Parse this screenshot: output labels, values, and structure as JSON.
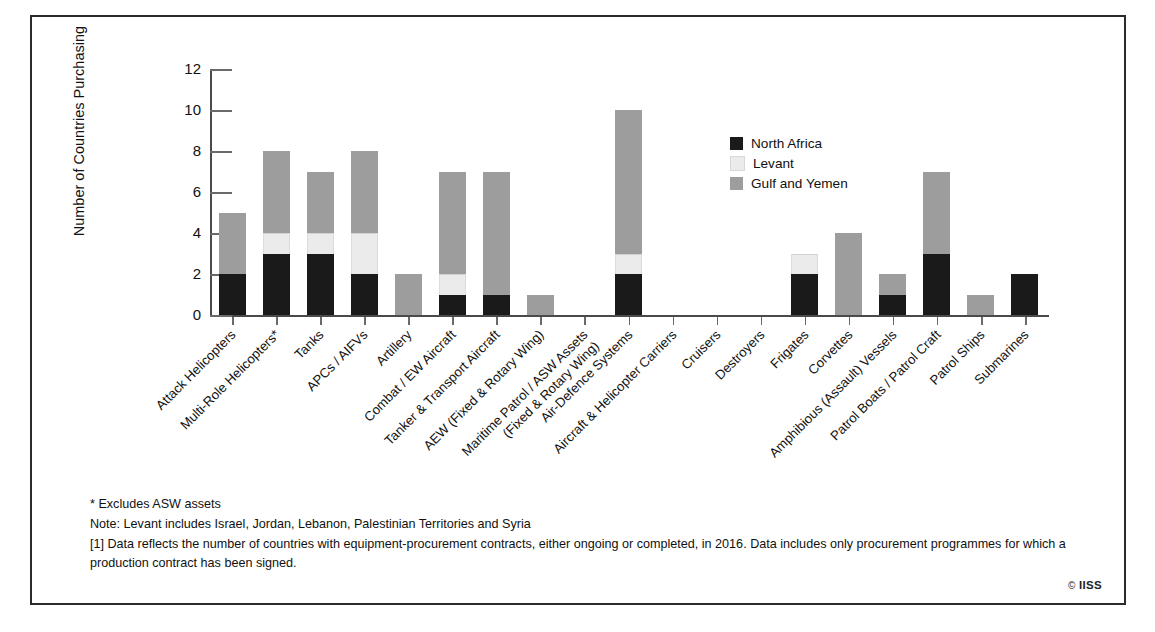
{
  "chart_data": {
    "type": "bar",
    "stacked": true,
    "title": "",
    "xlabel": "",
    "ylabel": "Number of Countries Purchasing",
    "ylim": [
      0,
      12
    ],
    "yticks": [
      0,
      2,
      4,
      6,
      8,
      10,
      12
    ],
    "grid": false,
    "legend_position": "inside-top-right",
    "categories": [
      "Attack Helicopters",
      "Multi-Role Helicopters*",
      "Tanks",
      "APCs / AIFVs",
      "Artillery",
      "Combat / EW Aircraft",
      "Tanker & Transport Aircraft",
      "AEW (Fixed & Rotary Wing)",
      "Maritime Patrol / ASW Assets\n(Fixed & Rotary Wing)",
      "Air-Defence Systems",
      "Aircraft & Helicopter Carriers",
      "Cruisers",
      "Destroyers",
      "Frigates",
      "Corvettes",
      "Amphibious (Assault) Vessels",
      "Patrol Boats / Patrol Craft",
      "Patrol Ships",
      "Submarines"
    ],
    "series": [
      {
        "name": "North Africa",
        "color": "#1a1a1a",
        "values": [
          2,
          3,
          3,
          2,
          0,
          1,
          1,
          0,
          0,
          2,
          0,
          0,
          0,
          2,
          0,
          1,
          3,
          0,
          2
        ]
      },
      {
        "name": "Levant",
        "color": "#ebebeb",
        "values": [
          0,
          1,
          1,
          2,
          0,
          1,
          0,
          0,
          0,
          1,
          0,
          0,
          0,
          1,
          0,
          0,
          0,
          0,
          0
        ]
      },
      {
        "name": "Gulf and Yemen",
        "color": "#9d9d9d",
        "values": [
          3,
          4,
          3,
          4,
          2,
          5,
          6,
          1,
          0,
          7,
          0,
          0,
          0,
          0,
          4,
          1,
          4,
          1,
          0
        ]
      }
    ],
    "totals": [
      5,
      8,
      7,
      8,
      2,
      7,
      7,
      1,
      0,
      10,
      0,
      0,
      0,
      3,
      4,
      2,
      7,
      1,
      2
    ]
  },
  "legend": {
    "items": [
      {
        "label": "North Africa",
        "color": "#1a1a1a"
      },
      {
        "label": "Levant",
        "color": "#ebebeb"
      },
      {
        "label": "Gulf and Yemen",
        "color": "#9d9d9d"
      }
    ]
  },
  "notes": {
    "asterisk": "* Excludes ASW assets",
    "note": "Note: Levant includes Israel, Jordan, Lebanon, Palestinian Territories and Syria",
    "footnote": "[1] Data reflects the number of countries with equipment-procurement contracts, either ongoing or completed, in 2016. Data includes only procurement programmes for which a production contract has been signed."
  },
  "copyright": {
    "symbol": "©",
    "text": "IISS"
  }
}
